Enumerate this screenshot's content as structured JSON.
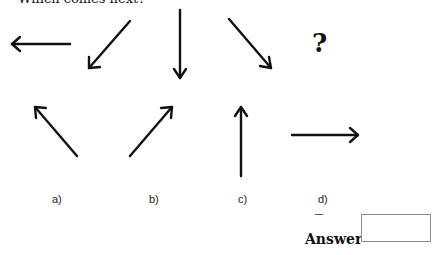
{
  "question": {
    "heading": "Which comes next?",
    "sequence": [
      {
        "direction": "left",
        "icon": "arrow-left-icon"
      },
      {
        "direction": "down-left",
        "icon": "arrow-down-left-icon"
      },
      {
        "direction": "down",
        "icon": "arrow-down-icon"
      },
      {
        "direction": "down-right",
        "icon": "arrow-down-right-icon"
      }
    ],
    "placeholder_symbol": "?"
  },
  "options": [
    {
      "label": "a)",
      "direction": "up-left",
      "icon": "arrow-up-left-icon"
    },
    {
      "label": "b)",
      "direction": "up-right",
      "icon": "arrow-up-right-icon"
    },
    {
      "label": "c)",
      "direction": "up",
      "icon": "arrow-up-icon"
    },
    {
      "label": "d)",
      "direction": "right",
      "icon": "arrow-right-icon"
    }
  ],
  "answer": {
    "label": "Answer",
    "value": ""
  }
}
